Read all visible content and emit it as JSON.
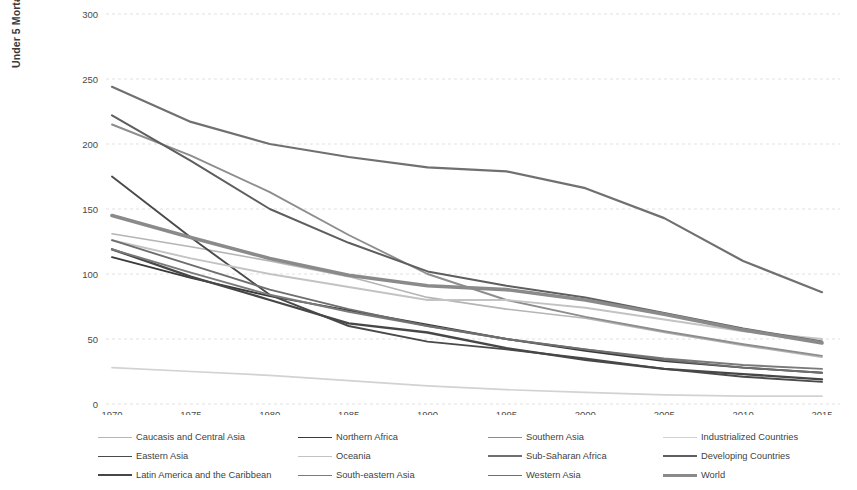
{
  "chart_data": {
    "type": "line",
    "title": "",
    "xlabel": "",
    "ylabel": "Under 5 Mortality Rates per 1,000 Live Births",
    "x": [
      1970,
      1975,
      1980,
      1985,
      1990,
      1995,
      2000,
      2005,
      2010,
      2015
    ],
    "xtick_labels": [
      "1970",
      "1975",
      "1980",
      "1985",
      "1990",
      "1995",
      "2000",
      "2005",
      "2010",
      "2015"
    ],
    "ytick_labels": [
      "0",
      "50",
      "100",
      "150",
      "200",
      "250",
      "300"
    ],
    "yticks": [
      0,
      50,
      100,
      150,
      200,
      250,
      300
    ],
    "ylim": [
      0,
      300
    ],
    "xlim": [
      1970,
      2015
    ],
    "grid": true,
    "legend_position": "bottom",
    "series": [
      {
        "name": "Caucasis and Central Asia",
        "color": "#b5b5b5",
        "width": 1.6,
        "values": [
          131,
          121,
          110,
          98,
          82,
          73,
          66,
          55,
          45,
          36
        ]
      },
      {
        "name": "Northern Africa",
        "color": "#3a3a3a",
        "width": 1.9,
        "values": [
          113,
          97,
          83,
          72,
          61,
          50,
          41,
          33,
          28,
          24
        ]
      },
      {
        "name": "Southern Asia",
        "color": "#8d8d8d",
        "width": 1.9,
        "values": [
          215,
          191,
          163,
          130,
          100,
          80,
          67,
          56,
          46,
          37
        ]
      },
      {
        "name": "Industrialized Countries",
        "color": "#d2d2d2",
        "width": 1.7,
        "values": [
          28,
          25,
          22,
          18,
          14,
          11,
          9,
          7,
          6,
          6
        ]
      },
      {
        "name": "Eastern Asia",
        "color": "#4a4a4a",
        "width": 1.9,
        "values": [
          175,
          128,
          84,
          60,
          48,
          42,
          35,
          27,
          21,
          17
        ]
      },
      {
        "name": "Oceania",
        "color": "#c3c3c3",
        "width": 1.9,
        "values": [
          126,
          112,
          100,
          90,
          80,
          80,
          74,
          65,
          56,
          50
        ]
      },
      {
        "name": "Sub-Saharan Africa",
        "color": "#707070",
        "width": 2.2,
        "values": [
          244,
          217,
          200,
          190,
          182,
          179,
          166,
          143,
          110,
          86
        ]
      },
      {
        "name": "Developing Countries",
        "color": "#5e5e5e",
        "width": 2.0,
        "values": [
          222,
          187,
          150,
          124,
          102,
          91,
          82,
          70,
          58,
          48
        ]
      },
      {
        "name": "Latin America and the Caribbean",
        "color": "#474747",
        "width": 2.3,
        "values": [
          119,
          98,
          80,
          62,
          55,
          43,
          34,
          27,
          23,
          19
        ]
      },
      {
        "name": "South-eastern Asia",
        "color": "#7a7a7a",
        "width": 1.9,
        "values": [
          119,
          101,
          84,
          71,
          60,
          50,
          42,
          35,
          30,
          27
        ]
      },
      {
        "name": "Western Asia",
        "color": "#6e6e6e",
        "width": 1.9,
        "values": [
          126,
          107,
          88,
          73,
          60,
          50,
          42,
          34,
          28,
          24
        ]
      },
      {
        "name": "World",
        "color": "#8a8a8a",
        "width": 3.6,
        "values": [
          145,
          128,
          112,
          99,
          91,
          88,
          80,
          69,
          57,
          47
        ]
      }
    ]
  },
  "legend": {
    "columns": [
      [
        "Caucasis and Central Asia",
        "Eastern Asia",
        "Latin America and the Caribbean"
      ],
      [
        "Northern Africa",
        "Oceania",
        "South-eastern Asia"
      ],
      [
        "Southern Asia",
        "Sub-Saharan Africa",
        "Western Asia"
      ],
      [
        "Industrialized Countries",
        "Developing Countries",
        "World"
      ]
    ]
  }
}
